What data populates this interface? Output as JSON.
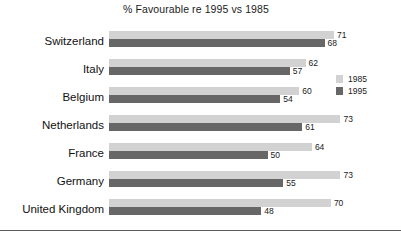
{
  "chart_data": {
    "type": "bar",
    "title": "% Favourable re 1995 vs 1985",
    "xlabel": "",
    "ylabel": "",
    "orientation": "horizontal",
    "grid": false,
    "xlim": [
      0,
      80
    ],
    "legend_position": "right",
    "categories": [
      "Switzerland",
      "Italy",
      "Belgium",
      "Netherlands",
      "France",
      "Germany",
      "United Kingdom"
    ],
    "series": [
      {
        "name": "1985",
        "color": "#d2d2d2",
        "values": [
          71,
          62,
          60,
          73,
          64,
          73,
          70
        ]
      },
      {
        "name": "1995",
        "color": "#676767",
        "values": [
          68,
          57,
          54,
          61,
          50,
          55,
          48
        ]
      }
    ]
  },
  "legend": {
    "items": [
      {
        "label": "1985",
        "color": "#d2d2d2"
      },
      {
        "label": "1995",
        "color": "#676767"
      }
    ]
  },
  "scale": {
    "px_per_unit": 3.17,
    "row_pitch": 28,
    "row_top_offset": 6
  }
}
